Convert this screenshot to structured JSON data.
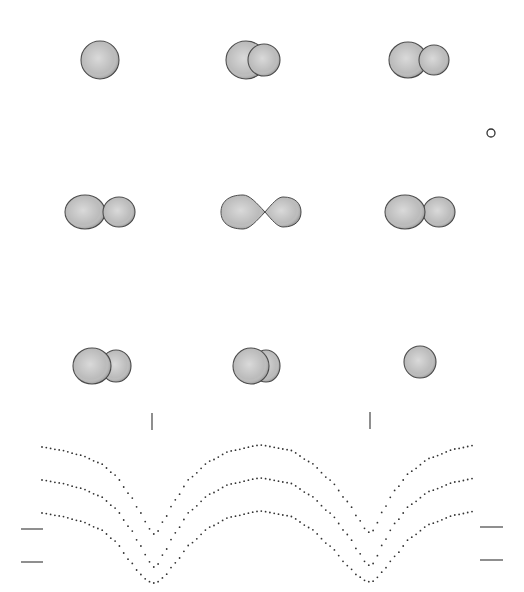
{
  "figure": {
    "colors": {
      "background": "#ffffff",
      "mesh_line": "#4a4a4a",
      "mesh_fill": "#d8d8d8",
      "curve_dot": "#333333",
      "tick": "#444444"
    },
    "panels": [
      {
        "row": 0,
        "col": 0,
        "cx": 100,
        "cy": 60,
        "view": "eclipse-total",
        "primary": {
          "dx": 0,
          "rx": 19,
          "ry": 19
        },
        "secondary": null
      },
      {
        "row": 0,
        "col": 1,
        "cx": 255,
        "cy": 60,
        "view": "partial-overlap",
        "primary": {
          "dx": -9,
          "rx": 20,
          "ry": 19
        },
        "secondary": {
          "dx": 9,
          "rx": 16,
          "ry": 16,
          "front": true
        }
      },
      {
        "row": 0,
        "col": 2,
        "cx": 420,
        "cy": 60,
        "view": "quadrature-approach",
        "primary": {
          "dx": -12,
          "rx": 19,
          "ry": 18
        },
        "secondary": {
          "dx": 14,
          "rx": 15,
          "ry": 15,
          "front": true
        }
      },
      {
        "row": 1,
        "col": 0,
        "cx": 100,
        "cy": 212,
        "view": "near-quadrature",
        "primary": {
          "dx": -15,
          "rx": 20,
          "ry": 17
        },
        "secondary": {
          "dx": 19,
          "rx": 16,
          "ry": 15,
          "front": true
        }
      },
      {
        "row": 1,
        "col": 1,
        "cx": 262,
        "cy": 212,
        "view": "quadrature",
        "primary": {
          "dx": -19,
          "rx": 22,
          "ry": 17,
          "teardrop": "right"
        },
        "secondary": {
          "dx": 21,
          "rx": 18,
          "ry": 15,
          "teardrop": "left"
        }
      },
      {
        "row": 1,
        "col": 2,
        "cx": 420,
        "cy": 212,
        "view": "near-quadrature",
        "primary": {
          "dx": -15,
          "rx": 20,
          "ry": 17
        },
        "secondary": {
          "dx": 19,
          "rx": 16,
          "ry": 15,
          "front": false
        }
      },
      {
        "row": 2,
        "col": 0,
        "cx": 102,
        "cy": 366,
        "view": "post-quadrature",
        "primary": {
          "dx": -10,
          "rx": 19,
          "ry": 18
        },
        "secondary": {
          "dx": 14,
          "rx": 15,
          "ry": 16,
          "front": false
        }
      },
      {
        "row": 2,
        "col": 1,
        "cx": 256,
        "cy": 366,
        "view": "partial-overlap",
        "primary": {
          "dx": -5,
          "rx": 18,
          "ry": 18
        },
        "secondary": {
          "dx": 10,
          "rx": 14,
          "ry": 16,
          "front": false
        }
      },
      {
        "row": 2,
        "col": 2,
        "cx": 420,
        "cy": 362,
        "view": "eclipse-total",
        "primary": {
          "dx": 0,
          "rx": 16,
          "ry": 16
        },
        "secondary": null
      }
    ],
    "marker": {
      "shape": "circle",
      "cx": 491,
      "cy": 133,
      "r": 4
    },
    "phase_ticks": [
      {
        "x": 152,
        "y1": 413,
        "y2": 430
      },
      {
        "x": 370,
        "y1": 412,
        "y2": 429
      }
    ],
    "level_marks": {
      "left": [
        {
          "x1": 21,
          "x2": 43,
          "y": 529
        },
        {
          "x1": 21,
          "x2": 43,
          "y": 562
        }
      ],
      "right": [
        {
          "x1": 480,
          "x2": 503,
          "y": 527
        },
        {
          "x1": 480,
          "x2": 503,
          "y": 560
        }
      ]
    }
  },
  "chart_data": {
    "type": "scatter",
    "title": "",
    "xlabel": "",
    "ylabel": "",
    "grid": false,
    "legend": null,
    "note": "Pixel-space light curves (y increases downward = fainter). Two minima per cycle at phase ticks x=152 and x=370.",
    "x": [
      42,
      60,
      80,
      100,
      115,
      130,
      140,
      148,
      152,
      156,
      164,
      175,
      190,
      210,
      230,
      260,
      290,
      310,
      330,
      348,
      358,
      366,
      370,
      374,
      382,
      395,
      410,
      430,
      455,
      476
    ],
    "series": [
      {
        "name": "curve-1",
        "offset": 0,
        "values": [
          447,
          450,
          455,
          463,
          475,
          495,
          512,
          526,
          534,
          534,
          520,
          500,
          478,
          461,
          451,
          445,
          450,
          462,
          480,
          502,
          518,
          530,
          533,
          530,
          512,
          490,
          472,
          458,
          449,
          445
        ]
      },
      {
        "name": "curve-2",
        "offset": 33,
        "values": [
          480,
          483,
          488,
          496,
          508,
          528,
          545,
          559,
          567,
          567,
          553,
          533,
          511,
          494,
          484,
          478,
          483,
          495,
          513,
          535,
          551,
          563,
          566,
          563,
          545,
          523,
          505,
          491,
          482,
          478
        ]
      },
      {
        "name": "curve-3",
        "offset": 66,
        "values": [
          513,
          516,
          521,
          529,
          541,
          561,
          574,
          581,
          583,
          583,
          577,
          563,
          544,
          527,
          517,
          511,
          516,
          528,
          546,
          566,
          576,
          581,
          582,
          581,
          572,
          556,
          538,
          524,
          515,
          511
        ]
      }
    ],
    "xlim": [
      0,
      524
    ],
    "ylim": [
      592,
      400
    ]
  }
}
